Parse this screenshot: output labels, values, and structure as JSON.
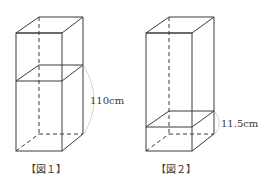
{
  "figures": [
    {
      "caption": "【図１】",
      "dimension_label": "110cm",
      "description": "Rectangular prism (container) with a horizontal cross-section marking a water level; arc indicates the height from the base to the level"
    },
    {
      "caption": "【図２】",
      "dimension_label": "11.5cm",
      "description": "Same rectangular prism with a lower horizontal cross-section; arc indicates the height from the base to the level"
    }
  ],
  "colors": {
    "line": "#3a3a3a",
    "arc": "#c8c8c8",
    "background": "#ffffff"
  }
}
